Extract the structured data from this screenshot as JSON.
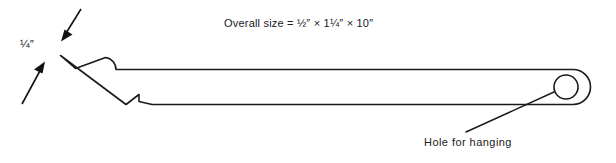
{
  "drawing": {
    "title_note": "Overall size  =  ½″ × 1¼″ × 10″",
    "thickness_note": "¼″",
    "hole_note": "Hole for hanging",
    "ink_color": "#1a1a1a",
    "background_color": "#ffffff"
  },
  "dimensions": {
    "thickness": "¼″",
    "overall_width": "½″",
    "overall_height": "1¼″",
    "overall_length": "10″"
  },
  "annotations": [
    {
      "name": "thickness-dimension",
      "text": "¼″"
    },
    {
      "name": "overall-size-note",
      "text": "Overall size  =  ½″ × 1¼″ × 10″"
    },
    {
      "name": "hole-callout",
      "text": "Hole for hanging"
    }
  ],
  "geometry": {
    "tool_body_label": "tool-profile-outline",
    "hole_label": "hanging-hole",
    "hole_center_x": 566,
    "hole_center_y": 87,
    "hole_radius": 12
  },
  "canvas": {
    "width": 616,
    "height": 163
  }
}
